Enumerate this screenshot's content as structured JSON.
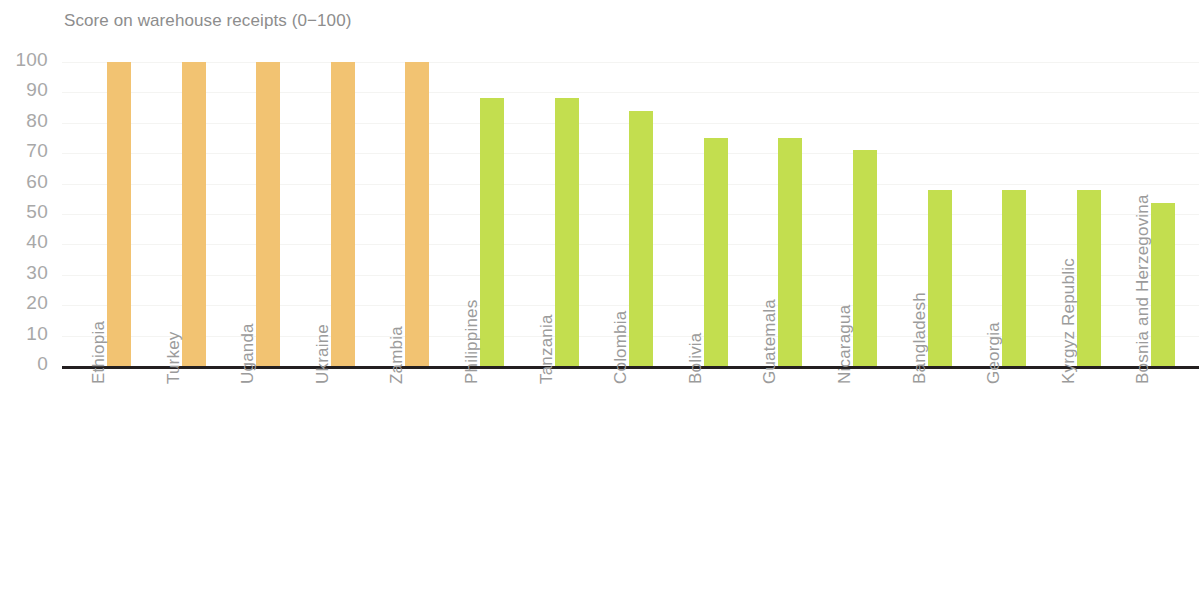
{
  "chart_data": {
    "type": "bar",
    "title": "Score on warehouse receipts (0−100)",
    "xlabel": "",
    "ylabel": "",
    "ylim": [
      0,
      100
    ],
    "yticks": [
      0,
      10,
      20,
      30,
      40,
      50,
      60,
      70,
      80,
      90,
      100
    ],
    "ytick_labels": [
      "0",
      "10",
      "20",
      "30",
      "40",
      "50",
      "60",
      "70",
      "80",
      "90",
      "100"
    ],
    "grid": true,
    "legend": "none",
    "categories": [
      "Ethiopia",
      "Turkey",
      "Uganda",
      "Ukraine",
      "Zambia",
      "Philippines",
      "Tanzania",
      "Colombia",
      "Bolivia",
      "Guatemala",
      "Nicaragua",
      "Bangladesh",
      "Georgia",
      "Kyrgyz Republic",
      "Bosnia and Herzegovina"
    ],
    "values": [
      100,
      100,
      100,
      100,
      100,
      88,
      88,
      84,
      75,
      75,
      71,
      58,
      58,
      58,
      53.5
    ],
    "bar_colors": [
      "#f2c372",
      "#f2c372",
      "#f2c372",
      "#f2c372",
      "#f2c372",
      "#c3de4f",
      "#c3de4f",
      "#c3de4f",
      "#c3de4f",
      "#c3de4f",
      "#c3de4f",
      "#c3de4f",
      "#c3de4f",
      "#c3de4f",
      "#c3de4f"
    ],
    "colors": {
      "bar_orange": "#f2c372",
      "bar_green": "#c3de4f",
      "axis_line": "#231f20",
      "tick_text": "#a8a8a8",
      "category_text": "#9b9b9b",
      "title_text": "#8d8d8d",
      "gridline": "#f4f4f2",
      "background": "#ffffff"
    }
  }
}
